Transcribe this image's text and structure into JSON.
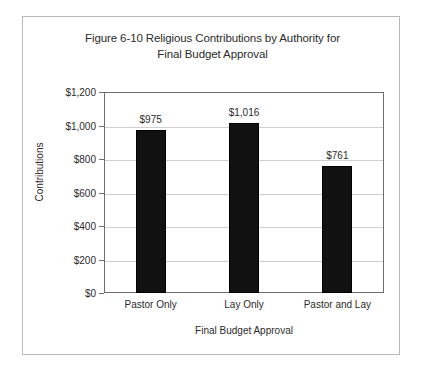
{
  "chart_data": {
    "type": "bar",
    "title": "Figure 6-10 Religious Contributions by Authority for Final Budget Approval",
    "title_line1": "Figure 6-10 Religious Contributions by Authority for",
    "title_line2": "Final Budget Approval",
    "xlabel": "Final Budget Approval",
    "ylabel": "Contributions",
    "categories": [
      "Pastor Only",
      "Lay Only",
      "Pastor and Lay"
    ],
    "values": [
      975,
      1016,
      761
    ],
    "value_labels": [
      "$975",
      "$1,016",
      "$761"
    ],
    "ylim": [
      0,
      1200
    ],
    "ytick_values": [
      0,
      200,
      400,
      600,
      800,
      1000,
      1200
    ],
    "ytick_labels": [
      "$0",
      "$200",
      "$400",
      "$600",
      "$800",
      "$1,000",
      "$1,200"
    ],
    "grid": true,
    "legend": false,
    "bar_color": "#111111",
    "gridline_color": "#cfcfcf",
    "axis_color": "#6e6e6e",
    "frame_color": "#b9b9b9",
    "background": "#ffffff"
  }
}
